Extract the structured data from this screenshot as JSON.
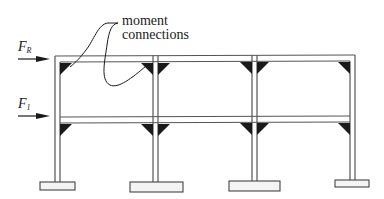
{
  "diagram": {
    "annotation": {
      "line1": "moment",
      "line2": "connections"
    },
    "forces": [
      {
        "symbol": "F",
        "subscript": "R",
        "level": "roof"
      },
      {
        "symbol": "F",
        "subscript": "1",
        "level": "first floor"
      }
    ],
    "columns": 4,
    "bays": 3,
    "stories": 2,
    "colors": {
      "line": "#555555",
      "fill_connection": "#1a1a1a",
      "footing_fill": "#f4f4f4",
      "background": "#ffffff"
    }
  }
}
